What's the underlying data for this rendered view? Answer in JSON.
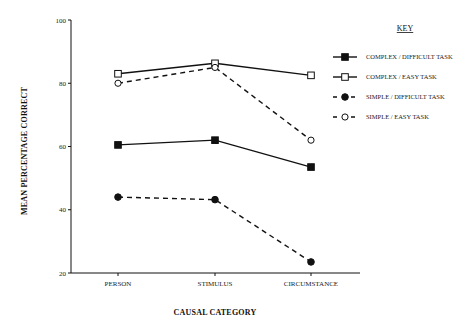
{
  "chart_data": {
    "type": "line",
    "title": "",
    "xlabel": "CAUSAL CATEGORY",
    "ylabel": "MEAN PERCENTAGE CORRECT",
    "categories": [
      "PERSON",
      "STIMULUS",
      "CIRCUMSTANCE"
    ],
    "ylim": [
      20,
      100
    ],
    "yticks": [
      20,
      40,
      60,
      80,
      100
    ],
    "grid": false,
    "legend_title": "KEY",
    "legend_position": "right",
    "series": [
      {
        "name": "COMPLEX / DIFFICULT TASK",
        "values": [
          60.5,
          62,
          53.5
        ],
        "marker": "filled-square",
        "line": "solid"
      },
      {
        "name": "COMPLEX / EASY TASK",
        "values": [
          83,
          86.3,
          82.5
        ],
        "marker": "open-square",
        "line": "solid"
      },
      {
        "name": "SIMPLE / DIFFICULT TASK",
        "values": [
          44,
          43.2,
          23.5
        ],
        "marker": "filled-circle",
        "line": "dashed"
      },
      {
        "name": "SIMPLE / EASY TASK",
        "values": [
          80,
          85,
          62
        ],
        "marker": "open-circle",
        "line": "dashed"
      }
    ]
  }
}
